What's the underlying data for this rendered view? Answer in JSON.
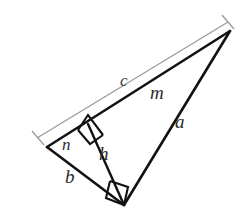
{
  "figure": {
    "background_color": "#ffffff",
    "stroke_color": "#121212",
    "dimension_color": "#9a9a9a",
    "label_color": "#2b2b2b"
  },
  "labels": {
    "hypotenuse_total": "c",
    "hypotenuse_segment_long": "m",
    "hypotenuse_segment_short": "n",
    "leg_long": "a",
    "leg_short": "b",
    "altitude": "h"
  },
  "vertices": {
    "apex_right": {
      "name": "A",
      "x": 230,
      "y": 31
    },
    "left": {
      "name": "B",
      "x": 47,
      "y": 147
    },
    "bottom": {
      "name": "C",
      "x": 124,
      "y": 205
    },
    "altitude_foot": {
      "name": "D",
      "x": 88,
      "y": 124
    }
  },
  "segments": [
    {
      "name": "hypotenuse",
      "label": "c",
      "from": "B",
      "to": "A"
    },
    {
      "name": "leg-a",
      "label": "a",
      "from": "C",
      "to": "A"
    },
    {
      "name": "leg-b",
      "label": "b",
      "from": "B",
      "to": "C"
    },
    {
      "name": "altitude-h",
      "label": "h",
      "from": "C",
      "to": "D"
    },
    {
      "name": "segment-m",
      "label": "m",
      "from": "D",
      "to": "A"
    },
    {
      "name": "segment-n",
      "label": "n",
      "from": "B",
      "to": "D"
    }
  ],
  "right_angles": [
    {
      "name": "right-angle-at-altitude-foot",
      "at": "D"
    },
    {
      "name": "right-angle-at-bottom-vertex",
      "at": "C"
    }
  ],
  "dimension": {
    "name": "hypotenuse-dimension-line",
    "label": "c",
    "from": {
      "x": 37,
      "y": 138
    },
    "to": {
      "x": 228,
      "y": 22
    }
  },
  "label_positions": {
    "c": {
      "left": 120,
      "top": 72
    },
    "m": {
      "left": 150,
      "top": 83
    },
    "a": {
      "left": 175,
      "top": 112
    },
    "h": {
      "left": 99,
      "top": 144
    },
    "n": {
      "left": 62,
      "top": 136
    },
    "b": {
      "left": 65,
      "top": 167
    }
  }
}
